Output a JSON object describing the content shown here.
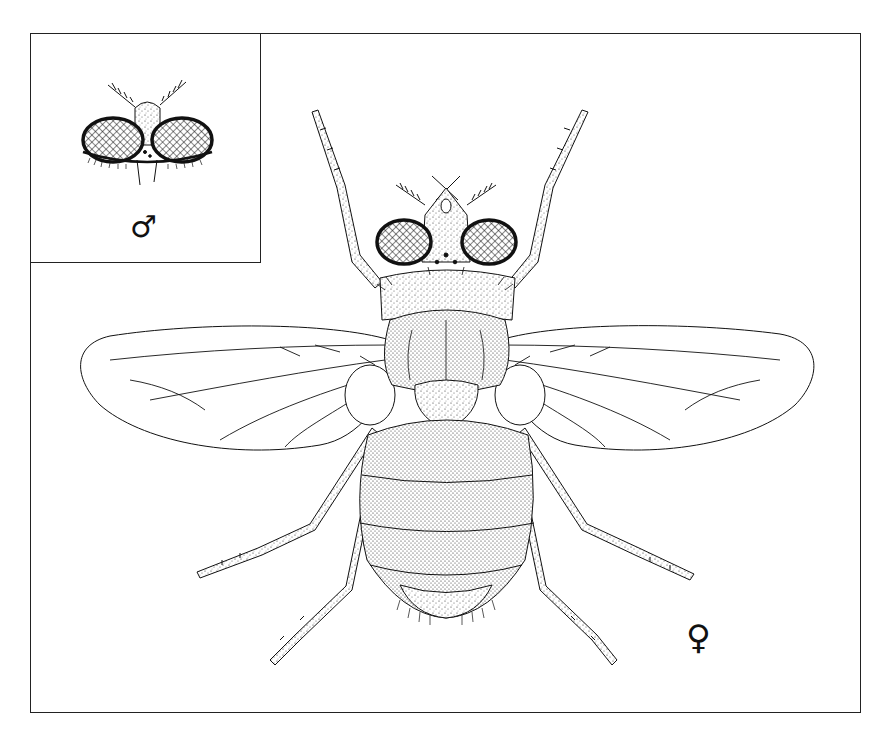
{
  "figure": {
    "inset": {
      "description": "Male head, dorsal view",
      "symbol": "♂"
    },
    "main": {
      "description": "Female fly, dorsal habitus",
      "symbol": "♀"
    },
    "colors": {
      "ink": "#111111",
      "background": "#ffffff"
    }
  }
}
